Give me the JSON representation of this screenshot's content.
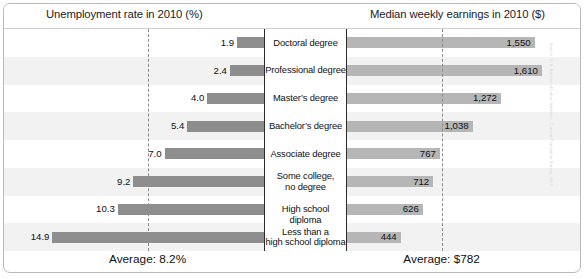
{
  "header": {
    "left_title": "Unemployment rate in 2010 (%)",
    "right_title": "Median weekly earnings in 2010 ($)"
  },
  "footer": {
    "left_average": "Average: 8.2%",
    "right_average": "Average: $782"
  },
  "credit": {
    "text": "Source: U.S. Bureau of Labor Statistics, Current Population Survey, 2010"
  },
  "chart_data": {
    "type": "bar",
    "orientation": "horizontal-diverging",
    "categories": [
      "Doctoral degree",
      "Professional degree",
      "Master's degree",
      "Bachelor's degree",
      "Associate degree",
      "Some college,\nno degree",
      "High school diploma",
      "Less than a\nhigh school diploma"
    ],
    "category_lines": [
      [
        "Doctoral degree"
      ],
      [
        "Professional degree"
      ],
      [
        "Master’s degree"
      ],
      [
        "Bachelor’s degree"
      ],
      [
        "Associate degree"
      ],
      [
        "Some college,",
        "no degree"
      ],
      [
        "High school diploma"
      ],
      [
        "Less than a",
        "high school diploma"
      ]
    ],
    "series": [
      {
        "name": "Unemployment rate in 2010 (%)",
        "side": "left",
        "unit": "%",
        "values": [
          1.9,
          2.4,
          4.0,
          5.4,
          7.0,
          9.2,
          10.3,
          14.9
        ],
        "labels": [
          "1.9",
          "2.4",
          "4.0",
          "5.4",
          "7.0",
          "9.2",
          "10.3",
          "14.9"
        ],
        "average": 8.2,
        "average_label": "Average: 8.2%",
        "axis_max": 16.2
      },
      {
        "name": "Median weekly earnings in 2010 ($)",
        "side": "right",
        "unit": "$",
        "values": [
          1550,
          1610,
          1272,
          1038,
          767,
          712,
          626,
          444
        ],
        "labels": [
          "1,550",
          "1,610",
          "1,272",
          "1,038",
          "767",
          "712",
          "626",
          "444"
        ],
        "average": 782,
        "average_label": "Average: $782",
        "axis_max": 1760
      }
    ],
    "grid": false,
    "legend": "none",
    "xlabel": "",
    "ylabel": "",
    "colors": {
      "bar_dark": "#8e8e8e",
      "bar_light": "#b6b6b6",
      "row_stripe": "#f2f2f2",
      "divider": "#2b2b2b",
      "dashed_line": "#8c8c8c",
      "frame": "#b9b9b9",
      "text": "#111111"
    }
  }
}
